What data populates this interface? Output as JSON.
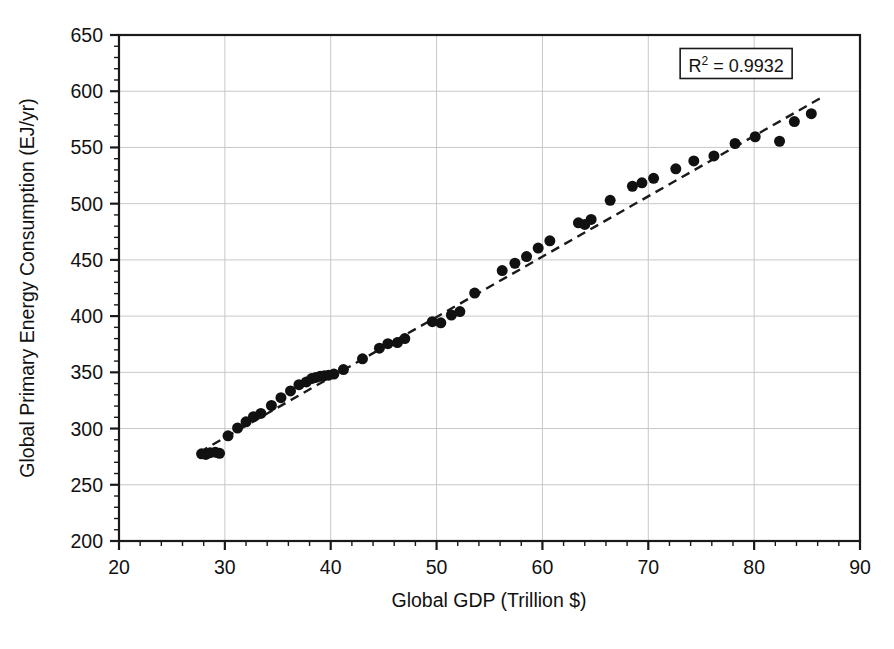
{
  "chart_data": {
    "type": "scatter",
    "title": "",
    "xlabel": "Global GDP (Trillion $)",
    "ylabel": "Global Primary Energy Consumption (EJ/yr)",
    "xlim": [
      20,
      90
    ],
    "ylim": [
      200,
      650
    ],
    "x_major_step": 10,
    "x_minor_step": 2,
    "y_major_step": 50,
    "y_minor_step": 10,
    "x_tick_labels": [
      "20",
      "30",
      "40",
      "50",
      "60",
      "70",
      "80",
      "90"
    ],
    "y_tick_labels": [
      "200",
      "250",
      "300",
      "350",
      "400",
      "450",
      "500",
      "550",
      "600",
      "650"
    ],
    "grid": "major-xy-light-gray",
    "legend": "none",
    "annotations": [
      {
        "name": "r-squared-box",
        "text_prefix": "R",
        "text_superscript": "2",
        "text_suffix": " = 0.9932",
        "value": 0.9932,
        "x": 78.3,
        "y": 622,
        "boxed": true
      }
    ],
    "series": [
      {
        "name": "GDP vs Primary Energy",
        "marker": "filled-circle",
        "marker_color": "#111111",
        "marker_size_px": 11,
        "points": [
          [
            27.8,
            277.5
          ],
          [
            28.2,
            277.0
          ],
          [
            28.6,
            278.5
          ],
          [
            29.1,
            279.0
          ],
          [
            29.5,
            278.0
          ],
          [
            30.3,
            293.5
          ],
          [
            31.2,
            300.5
          ],
          [
            32.0,
            306.0
          ],
          [
            32.7,
            310.5
          ],
          [
            33.4,
            313.5
          ],
          [
            34.4,
            320.5
          ],
          [
            35.3,
            327.5
          ],
          [
            36.2,
            333.5
          ],
          [
            37.0,
            339.0
          ],
          [
            37.7,
            341.5
          ],
          [
            38.2,
            344.5
          ],
          [
            38.6,
            345.5
          ],
          [
            39.0,
            346.5
          ],
          [
            39.4,
            347.0
          ],
          [
            39.8,
            347.5
          ],
          [
            40.3,
            348.5
          ],
          [
            41.2,
            352.5
          ],
          [
            43.0,
            362.0
          ],
          [
            44.6,
            371.5
          ],
          [
            45.4,
            375.5
          ],
          [
            46.3,
            376.5
          ],
          [
            47.0,
            380.0
          ],
          [
            49.6,
            395.0
          ],
          [
            50.4,
            394.0
          ],
          [
            51.4,
            401.0
          ],
          [
            52.2,
            404.0
          ],
          [
            53.6,
            420.5
          ],
          [
            56.2,
            440.5
          ],
          [
            57.4,
            447.0
          ],
          [
            58.5,
            453.0
          ],
          [
            59.6,
            460.5
          ],
          [
            60.7,
            467.0
          ],
          [
            63.4,
            483.0
          ],
          [
            64.0,
            481.5
          ],
          [
            64.6,
            486.0
          ],
          [
            66.4,
            503.0
          ],
          [
            68.5,
            515.5
          ],
          [
            69.4,
            518.5
          ],
          [
            70.5,
            522.5
          ],
          [
            72.6,
            531.0
          ],
          [
            74.3,
            538.0
          ],
          [
            76.2,
            542.5
          ],
          [
            78.2,
            553.5
          ],
          [
            80.1,
            559.5
          ],
          [
            82.4,
            555.5
          ],
          [
            83.8,
            573.0
          ],
          [
            85.4,
            580.0
          ]
        ]
      }
    ],
    "trendline": {
      "name": "linear-fit",
      "style": "dashed",
      "color": "#1a1a1a",
      "x_start": 27.6,
      "y_start": 279.0,
      "x_end": 86.2,
      "y_end": 593.5
    }
  },
  "figure": {
    "background": "#ffffff",
    "frame_color": "#1a1a1a",
    "grid_color": "#c8c8c8",
    "accent": "#111111"
  }
}
